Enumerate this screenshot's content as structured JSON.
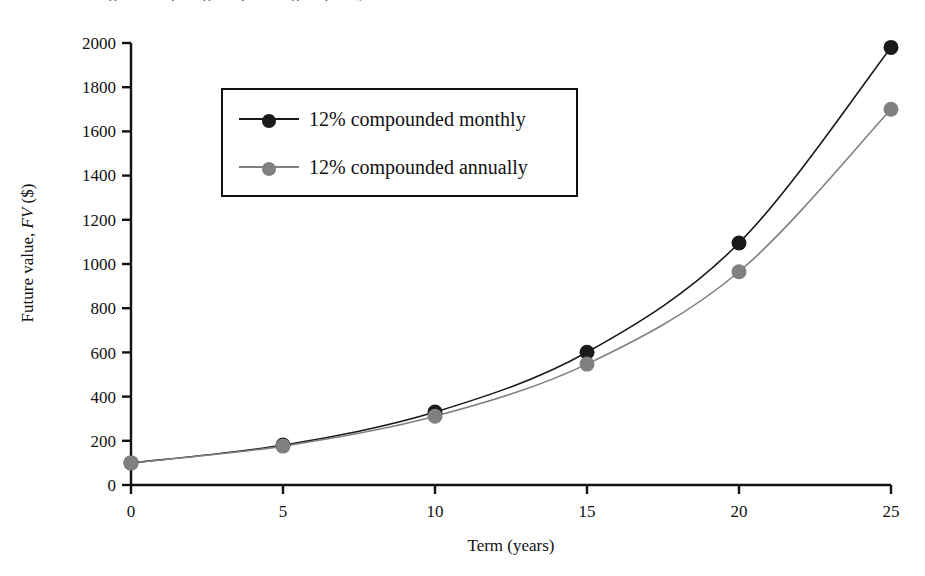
{
  "figure": {
    "truncated_caption_above": "Figure: comparing compounding frequency"
  },
  "chart_data": {
    "type": "line",
    "title": "",
    "subtitle": "",
    "xlabel": "Term (years)",
    "ylabel": "Future value, FV ($)",
    "ylabel_plain": "Future value, ",
    "ylabel_italic": "FV",
    "ylabel_suffix": " ($)",
    "x": [
      0,
      5,
      10,
      15,
      20,
      25
    ],
    "xlim": [
      0,
      25
    ],
    "ylim": [
      0,
      2000
    ],
    "xticks": [
      "0",
      "5",
      "10",
      "15",
      "20",
      "25"
    ],
    "yticks": [
      "0",
      "200",
      "400",
      "600",
      "800",
      "1000",
      "1200",
      "1400",
      "1600",
      "1800",
      "2000"
    ],
    "grid": false,
    "legend_position": "upper-left-inside",
    "series": [
      {
        "name": "12% compounded monthly",
        "color": "#1a1a1a",
        "marker": "circle",
        "values": [
          100,
          181,
          330,
          601,
          1095,
          1980
        ]
      },
      {
        "name": "12% compounded annually",
        "color": "#808080",
        "marker": "circle",
        "values": [
          100,
          176,
          311,
          547,
          965,
          1700
        ]
      }
    ]
  },
  "legend": {
    "items": [
      {
        "label": "12% compounded monthly",
        "color": "#1a1a1a"
      },
      {
        "label": "12% compounded annually",
        "color": "#808080"
      }
    ]
  },
  "axes": {
    "x_title": "Term (years)",
    "y_title_prefix": "Future value, ",
    "y_title_italic": "FV",
    "y_title_suffix": " ($)"
  },
  "colors": {
    "axis": "#111111",
    "series_monthly": "#1a1a1a",
    "series_annually": "#808080",
    "background": "#ffffff"
  }
}
